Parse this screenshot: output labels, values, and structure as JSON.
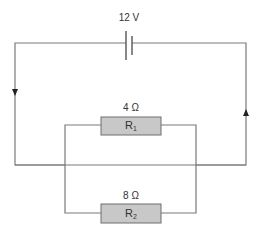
{
  "diagram": {
    "type": "circuit",
    "battery": {
      "label": "12 V"
    },
    "resistors": [
      {
        "name": "R",
        "subscript": "1",
        "value_label": "4 Ω"
      },
      {
        "name": "R",
        "subscript": "2",
        "value_label": "8 Ω"
      }
    ],
    "current_arrows": [
      {
        "side": "left",
        "direction": "down"
      },
      {
        "side": "right",
        "direction": "up"
      }
    ],
    "colors": {
      "wire": "#7a7a7a",
      "resistor_fill": "#c8c8c8",
      "text": "#333333"
    }
  }
}
